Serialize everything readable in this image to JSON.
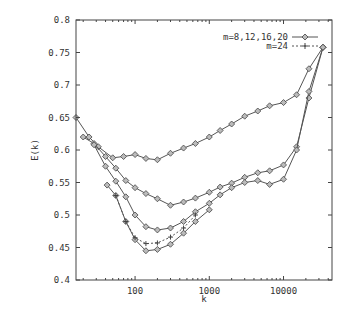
{
  "chart_data": {
    "type": "line",
    "title": "",
    "xlabel": "k",
    "ylabel": "E(k)",
    "xscale": "log",
    "xlim": [
      16,
      45000
    ],
    "ylim": [
      0.4,
      0.8
    ],
    "x_ticks": [
      "100",
      "1000",
      "10000"
    ],
    "y_ticks": [
      "0.4",
      "0.45",
      "0.5",
      "0.55",
      "0.6",
      "0.65",
      "0.7",
      "0.75",
      "0.8"
    ],
    "grid": false,
    "legend_position": "top-right",
    "legend": [
      {
        "label": "m=8,12,16,20",
        "style": "solid-diamond"
      },
      {
        "label": "m=24",
        "style": "dashed-plus"
      }
    ],
    "series": [
      {
        "name": "m=8",
        "group": "m=8,12,16,20",
        "x": [
          16,
          24,
          32,
          50,
          70,
          100,
          140,
          200,
          300,
          450,
          650,
          1000,
          1400,
          2000,
          3000,
          4500,
          6500,
          10000,
          15000,
          22000,
          34000
        ],
        "y": [
          0.65,
          0.62,
          0.605,
          0.588,
          0.59,
          0.593,
          0.587,
          0.585,
          0.595,
          0.603,
          0.61,
          0.62,
          0.63,
          0.64,
          0.652,
          0.66,
          0.668,
          0.673,
          0.685,
          0.725,
          0.758
        ]
      },
      {
        "name": "m=12",
        "group": "m=8,12,16,20",
        "x": [
          20,
          28,
          40,
          55,
          75,
          100,
          140,
          200,
          300,
          450,
          650,
          1000,
          1400,
          2000,
          3000,
          4500,
          6500,
          10000,
          15000,
          22000,
          34000
        ],
        "y": [
          0.62,
          0.61,
          0.59,
          0.572,
          0.553,
          0.542,
          0.533,
          0.525,
          0.515,
          0.52,
          0.526,
          0.535,
          0.543,
          0.549,
          0.558,
          0.565,
          0.568,
          0.577,
          0.605,
          0.68,
          0.758
        ]
      },
      {
        "name": "m=16",
        "group": "m=8,12,16,20",
        "x": [
          28,
          40,
          55,
          75,
          100,
          140,
          200,
          300,
          450,
          650,
          1000,
          1400,
          2000,
          3000,
          4500,
          6500,
          10000,
          15000,
          22000,
          34000
        ],
        "y": [
          0.608,
          0.575,
          0.552,
          0.528,
          0.5,
          0.482,
          0.477,
          0.48,
          0.49,
          0.505,
          0.518,
          0.531,
          0.542,
          0.55,
          0.553,
          0.547,
          0.555,
          0.6,
          0.69,
          0.758
        ]
      },
      {
        "name": "m=20",
        "group": "m=8,12,16,20",
        "x": [
          42,
          55,
          75,
          100,
          140,
          200,
          300,
          450,
          650,
          1000
        ],
        "y": [
          0.546,
          0.53,
          0.49,
          0.462,
          0.445,
          0.447,
          0.455,
          0.472,
          0.49,
          0.508
        ]
      },
      {
        "name": "m=24",
        "group": "m=24",
        "x": [
          55,
          75,
          100,
          140,
          200,
          300,
          450,
          650
        ],
        "y": [
          0.53,
          0.49,
          0.465,
          0.456,
          0.457,
          0.466,
          0.48,
          0.5
        ]
      }
    ]
  }
}
